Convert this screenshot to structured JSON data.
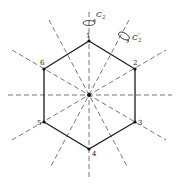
{
  "diagram": {
    "colors": {
      "edge": "#1a1a1a",
      "axis": "#555555",
      "background": "#ffffff"
    },
    "center": {
      "x": 89,
      "y": 95
    },
    "vertices": [
      {
        "label": "1",
        "x": 89,
        "y": 41,
        "lx": 86,
        "ly": 36
      },
      {
        "label": "2",
        "x": 135,
        "y": 69,
        "lx": 134,
        "ly": 64
      },
      {
        "label": "3",
        "x": 135,
        "y": 122,
        "lx": 138,
        "ly": 124
      },
      {
        "label": "4",
        "x": 89,
        "y": 149,
        "lx": 92,
        "ly": 155
      },
      {
        "label": "5",
        "x": 44,
        "y": 122,
        "lx": 37,
        "ly": 124
      },
      {
        "label": "6",
        "x": 44,
        "y": 69,
        "lx": 41,
        "ly": 64
      }
    ],
    "symbols": {
      "c2_prime": {
        "base": "C",
        "sub": "2",
        "sup": "′"
      },
      "c2_double_prime": {
        "base": "C",
        "sub": "2",
        "sup": "″"
      }
    }
  }
}
